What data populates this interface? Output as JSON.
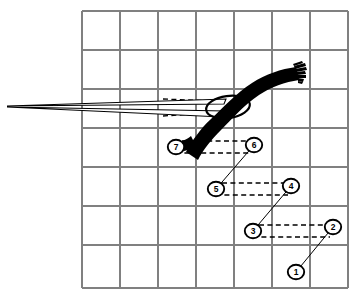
{
  "figure": {
    "background_color": "#ffffff",
    "ink_color": "#000000",
    "grid_color": "#808080"
  },
  "grid": {
    "x0": 82,
    "y0": 11,
    "x1": 348,
    "y1": 288,
    "columns": 7,
    "rows": 7,
    "cell_width": 38,
    "cell_height": 39.57,
    "vertical_lines": [
      82,
      120,
      158,
      196,
      234,
      272,
      310,
      348
    ],
    "horizontal_lines": [
      11,
      50,
      89,
      128,
      167,
      206,
      245,
      288
    ]
  },
  "hook": {
    "name": "curved-band",
    "description": "Thick black curved band sweeping from lower-left up to upper-right with frayed brush end",
    "fray_strokes": 7
  },
  "ellipse": {
    "name": "ellipse-outline",
    "cx": 228,
    "cy": 107,
    "rx": 22,
    "ry": 11,
    "rotation": -8
  },
  "wedge": {
    "name": "pointer-wedge",
    "apex_x": 7,
    "apex_y": 106,
    "description": "Thin elongated triangular pointer converging at left margin"
  },
  "markers": [
    {
      "id": "1",
      "label": "1",
      "cx": 296,
      "cy": 272
    },
    {
      "id": "2",
      "label": "2",
      "cx": 333,
      "cy": 227
    },
    {
      "id": "3",
      "label": "3",
      "cx": 253,
      "cy": 231
    },
    {
      "id": "4",
      "label": "4",
      "cx": 291,
      "cy": 186
    },
    {
      "id": "5",
      "label": "5",
      "cx": 216,
      "cy": 189
    },
    {
      "id": "6",
      "label": "6",
      "cx": 254,
      "cy": 145
    },
    {
      "id": "7",
      "label": "7",
      "cx": 176,
      "cy": 147
    }
  ],
  "bars": [
    {
      "name": "bar-1-2",
      "from": "1",
      "to": "2"
    },
    {
      "name": "bar-3-4",
      "from": "3",
      "to": "4"
    },
    {
      "name": "bar-5-6",
      "from": "5",
      "to": "6"
    },
    {
      "name": "bar-7-hook",
      "from": "7",
      "to": "hook"
    }
  ],
  "dashed_connectors": [
    {
      "name": "connector-7-6",
      "x1": 176,
      "x2": 254,
      "y_top": 141,
      "y_bottom": 153
    },
    {
      "name": "connector-5-4",
      "x1": 216,
      "x2": 291,
      "y_top": 183,
      "y_bottom": 195
    },
    {
      "name": "connector-3-2",
      "x1": 253,
      "x2": 333,
      "y_top": 225,
      "y_bottom": 237
    },
    {
      "name": "connector-wedge-top",
      "x1": 163,
      "x2": 216,
      "y": 99
    },
    {
      "name": "connector-wedge-bottom",
      "x1": 163,
      "x2": 216,
      "y": 116
    }
  ]
}
